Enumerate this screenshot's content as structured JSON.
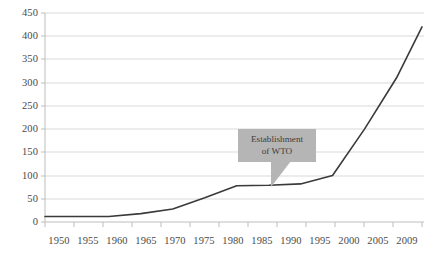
{
  "chart_data": {
    "type": "line",
    "title": "",
    "subtitle": "",
    "xlabel": "",
    "ylabel": "",
    "x": [
      1950,
      1955,
      1960,
      1965,
      1970,
      1975,
      1980,
      1985,
      1990,
      1995,
      2000,
      2005,
      2009
    ],
    "categories": [
      "1950",
      "1955",
      "1960",
      "1965",
      "1970",
      "1975",
      "1980",
      "1985",
      "1990",
      "1995",
      "2000",
      "2005",
      "2009"
    ],
    "values": [
      12,
      12,
      12,
      18,
      28,
      52,
      78,
      79,
      82,
      100,
      200,
      310,
      420
    ],
    "series": [
      {
        "name": "Cumulative number of agreements",
        "values": [
          12,
          12,
          12,
          18,
          28,
          52,
          78,
          79,
          82,
          100,
          200,
          310,
          420
        ],
        "color": "#3a3a3a"
      }
    ],
    "ylim": [
      0,
      450
    ],
    "yticks": [
      0,
      50,
      100,
      150,
      200,
      250,
      300,
      350,
      400,
      450
    ],
    "ytick_labels": [
      "0",
      "50",
      "100",
      "150",
      "200",
      "250",
      "300",
      "350",
      "400",
      "450"
    ],
    "xtick_labels": [
      "1950",
      "1955",
      "1960",
      "1965",
      "1970",
      "1975",
      "1980",
      "1985",
      "1990",
      "1995",
      "2000",
      "2005",
      "2009"
    ],
    "grid": true,
    "grid_axis": "y",
    "grid_color": "#d9d9d9",
    "legend": false,
    "legend_position": "none",
    "annotations": [
      {
        "name": "establishment-of-wto",
        "line1": "Establishment",
        "line2": "of WTO",
        "points_to_x": 1995,
        "points_to_y": 100,
        "background": "#b5b5b5",
        "text_color": "#3d3d3d"
      }
    ],
    "axis_color": "#bdbdbd",
    "background": "#ffffff"
  }
}
